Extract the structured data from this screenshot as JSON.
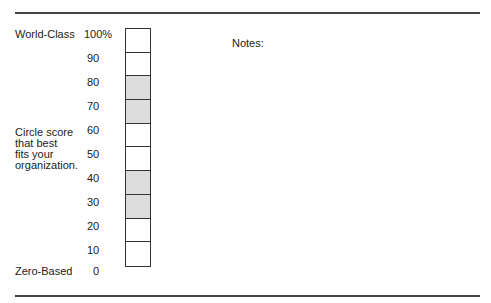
{
  "scale": {
    "top_label": "World-Class",
    "bottom_label": "Zero-Based",
    "instruction_lines": [
      "Circle score",
      "that best",
      "fits your",
      "organization."
    ],
    "ticks": [
      "100%",
      "90",
      "80",
      "70",
      "60",
      "50",
      "40",
      "30",
      "20",
      "10",
      "0"
    ],
    "cells": [
      {
        "range": "90-100",
        "shaded": false
      },
      {
        "range": "80-90",
        "shaded": false
      },
      {
        "range": "70-80",
        "shaded": true
      },
      {
        "range": "60-70",
        "shaded": true
      },
      {
        "range": "50-60",
        "shaded": false
      },
      {
        "range": "40-50",
        "shaded": false
      },
      {
        "range": "30-40",
        "shaded": true
      },
      {
        "range": "20-30",
        "shaded": true
      },
      {
        "range": "10-20",
        "shaded": false
      },
      {
        "range": "0-10",
        "shaded": false
      }
    ],
    "shade_color": "#dcdcdc"
  },
  "notes": {
    "label": "Notes:"
  }
}
